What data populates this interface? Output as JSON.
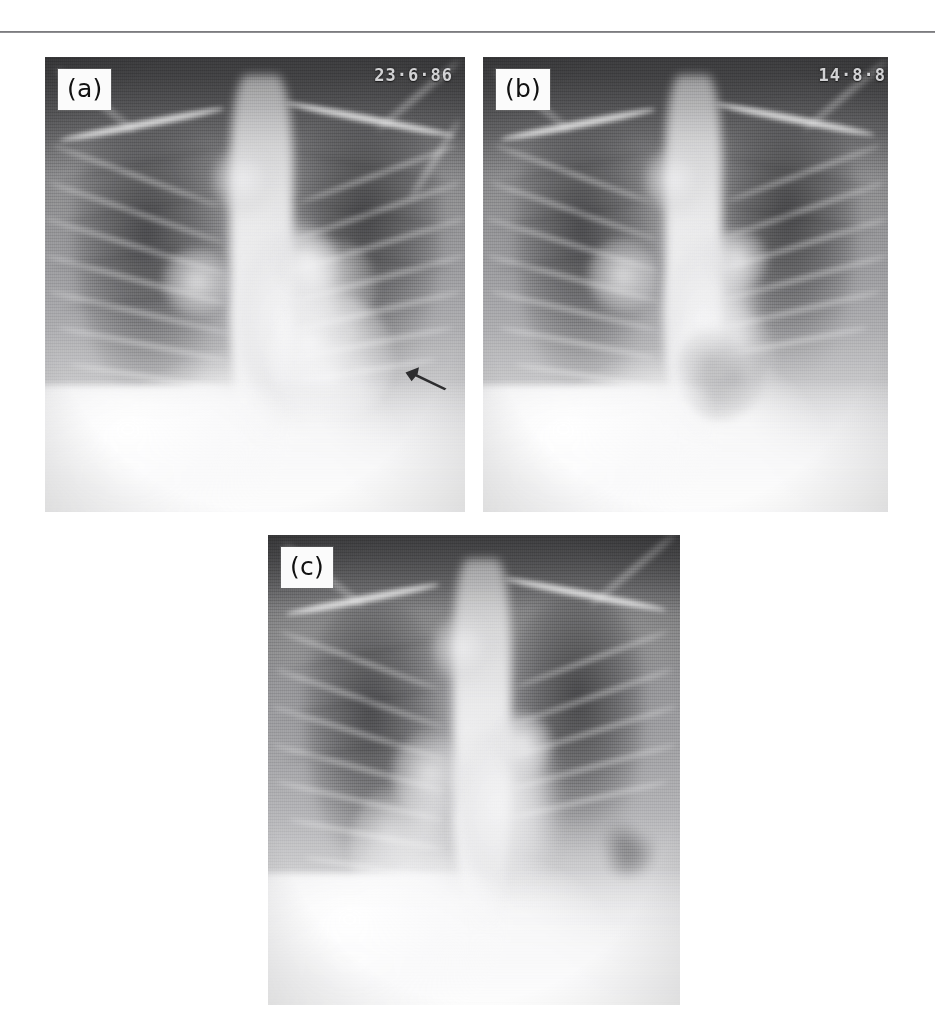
{
  "figure": {
    "kind": "radiograph-figure",
    "panel_count": 3,
    "modality_note": "chest-radiograph",
    "rule_color": "#6f6f72",
    "background_color": "#ffffff"
  },
  "panels": [
    {
      "id": "a",
      "label": "(a)",
      "date_stamp": "23·6·86",
      "has_date_stamp": true,
      "has_arrow": true,
      "arrow_name": "lesion-pointer-arrow",
      "arrow_color": "#2d2d2f",
      "x": 45,
      "y": 57,
      "w": 420,
      "h": 455
    },
    {
      "id": "b",
      "label": "(b)",
      "date_stamp": "14·8·8",
      "has_date_stamp": true,
      "has_arrow": false,
      "arrow_name": "",
      "arrow_color": "",
      "x": 483,
      "y": 57,
      "w": 405,
      "h": 455
    },
    {
      "id": "c",
      "label": "(c)",
      "date_stamp": "",
      "has_date_stamp": false,
      "has_arrow": false,
      "arrow_name": "",
      "arrow_color": "",
      "x": 268,
      "y": 535,
      "w": 412,
      "h": 470
    }
  ]
}
